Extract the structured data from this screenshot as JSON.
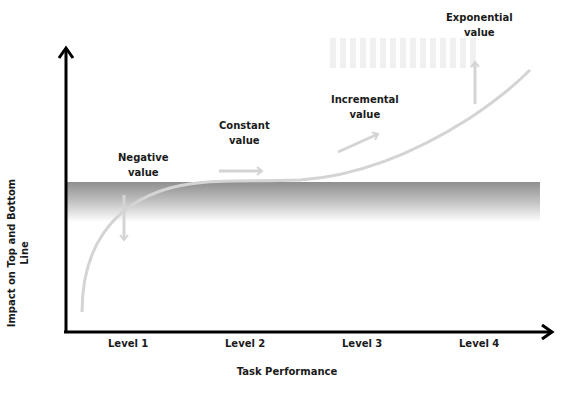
{
  "diagram": {
    "y_axis_label": "Impact on Top and Bottom Line",
    "x_axis_label": "Task Performance",
    "levels": [
      "Level 1",
      "Level 2",
      "Level 3",
      "Level 4"
    ],
    "stages": [
      {
        "line1": "Negative",
        "line2": "value",
        "direction": "down"
      },
      {
        "line1": "Constant",
        "line2": "value",
        "direction": "right"
      },
      {
        "line1": "Incremental",
        "line2": "value",
        "direction": "up-right"
      },
      {
        "line1": "Exponential",
        "line2": "value",
        "direction": "up"
      }
    ],
    "colors": {
      "axis": "#000000",
      "curve": "#d4d4d4",
      "band_top": "#8f8f8f",
      "band_bottom": "#ffffff"
    }
  }
}
